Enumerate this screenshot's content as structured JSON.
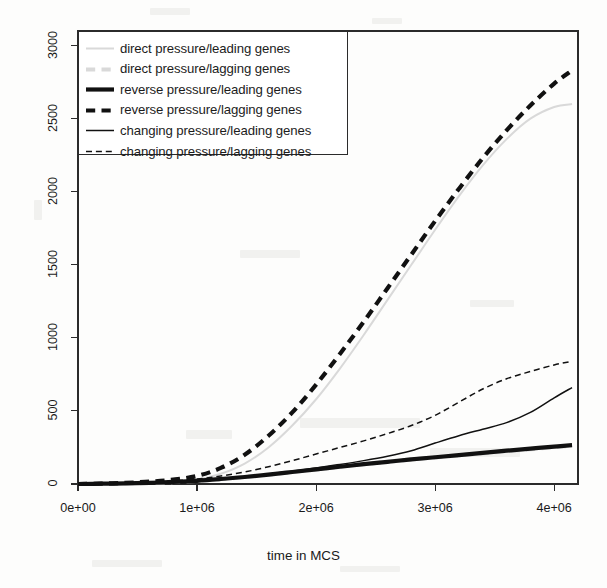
{
  "figure": {
    "background": "#fdfdfc",
    "plot_box": {
      "left": 78,
      "top": 31,
      "right": 578,
      "bottom": 484
    }
  },
  "axes": {
    "x_title": "time in MCS",
    "y_title": "",
    "x_ticks": [
      "0e+00",
      "1e+06",
      "2e+06",
      "3e+06",
      "4e+06"
    ],
    "x_tick_values": [
      0,
      1000000,
      2000000,
      3000000,
      4000000
    ],
    "y_ticks": [
      "0",
      "500",
      "1000",
      "1500",
      "2000",
      "2500",
      "3000"
    ],
    "y_tick_values": [
      0,
      500,
      1000,
      1500,
      2000,
      2500,
      3000
    ]
  },
  "legend": {
    "entries": [
      {
        "label": "direct pressure/leading genes",
        "color": "#d9d9d9",
        "width": 2.0,
        "dash": "solid"
      },
      {
        "label": "direct pressure/lagging genes",
        "color": "#d9d9d9",
        "width": 4.2,
        "dash": "dashed"
      },
      {
        "label": "reverse pressure/leading genes",
        "color": "#111111",
        "width": 4.2,
        "dash": "solid"
      },
      {
        "label": "reverse pressure/lagging genes",
        "color": "#111111",
        "width": 4.2,
        "dash": "dashed"
      },
      {
        "label": "changing pressure/leading genes",
        "color": "#111111",
        "width": 1.5,
        "dash": "solid"
      },
      {
        "label": "changing pressure/lagging genes",
        "color": "#111111",
        "width": 1.5,
        "dash": "dashed"
      }
    ]
  },
  "chart_data": {
    "type": "line",
    "title": "",
    "xlabel": "time in MCS",
    "ylabel": "",
    "xlim": [
      0,
      4200000
    ],
    "ylim": [
      0,
      3100
    ],
    "grid": false,
    "legend_position": "top-left",
    "x": [
      0,
      200000,
      400000,
      600000,
      800000,
      1000000,
      1200000,
      1400000,
      1600000,
      1800000,
      2000000,
      2200000,
      2400000,
      2600000,
      2800000,
      3000000,
      3200000,
      3400000,
      3600000,
      3800000,
      4000000,
      4150000
    ],
    "series": [
      {
        "name": "direct pressure/leading genes",
        "color": "#d9d9d9",
        "dash": "solid",
        "width": 2.0,
        "values": [
          0,
          2,
          5,
          10,
          18,
          30,
          70,
          140,
          250,
          400,
          580,
          790,
          1020,
          1260,
          1500,
          1740,
          1970,
          2180,
          2360,
          2500,
          2580,
          2600
        ]
      },
      {
        "name": "direct pressure/lagging genes",
        "color": "#d9d9d9",
        "dash": "dashed",
        "width": 4.2,
        "values": [
          0,
          2,
          4,
          8,
          14,
          22,
          34,
          48,
          64,
          82,
          100,
          118,
          136,
          152,
          168,
          182,
          196,
          210,
          224,
          238,
          252,
          262
        ]
      },
      {
        "name": "reverse pressure/leading genes",
        "color": "#111111",
        "dash": "solid",
        "width": 4.2,
        "values": [
          0,
          2,
          4,
          8,
          14,
          22,
          34,
          48,
          64,
          82,
          100,
          118,
          136,
          152,
          168,
          183,
          198,
          213,
          228,
          242,
          256,
          266
        ]
      },
      {
        "name": "reverse pressure/lagging genes",
        "color": "#111111",
        "dash": "dashed",
        "width": 4.2,
        "values": [
          0,
          3,
          8,
          16,
          30,
          55,
          110,
          200,
          330,
          490,
          680,
          890,
          1110,
          1340,
          1570,
          1800,
          2020,
          2230,
          2420,
          2590,
          2740,
          2830
        ]
      },
      {
        "name": "changing pressure/leading genes",
        "color": "#111111",
        "dash": "solid",
        "width": 1.5,
        "values": [
          0,
          2,
          4,
          8,
          14,
          22,
          34,
          50,
          68,
          88,
          110,
          134,
          160,
          190,
          228,
          280,
          330,
          375,
          420,
          490,
          590,
          660
        ]
      },
      {
        "name": "changing pressure/lagging genes",
        "color": "#111111",
        "dash": "dashed",
        "width": 1.5,
        "values": [
          0,
          3,
          7,
          13,
          22,
          34,
          55,
          82,
          118,
          160,
          205,
          250,
          295,
          345,
          400,
          470,
          560,
          650,
          720,
          770,
          815,
          840
        ]
      }
    ]
  }
}
